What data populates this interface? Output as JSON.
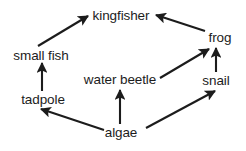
{
  "diagram": {
    "width": 246,
    "height": 151,
    "background_color": "#ffffff",
    "stroke_color": "#1c1c1c",
    "text_color": "#1c1c1c"
  },
  "nodes": [
    {
      "id": "kingfisher",
      "label": "kingfisher",
      "x": 121,
      "y": 15
    },
    {
      "id": "frog",
      "label": "frog",
      "x": 220,
      "y": 37
    },
    {
      "id": "small_fish",
      "label": "small fish",
      "x": 41,
      "y": 55
    },
    {
      "id": "water_beetle",
      "label": "water beetle",
      "x": 120,
      "y": 79
    },
    {
      "id": "snail",
      "label": "snail",
      "x": 216,
      "y": 80
    },
    {
      "id": "tadpole",
      "label": "tadpole",
      "x": 43,
      "y": 99
    },
    {
      "id": "algae",
      "label": "algae",
      "x": 121,
      "y": 132
    }
  ],
  "edges": [
    {
      "id": "small_fish-to-kingfisher",
      "from": "small fish",
      "to": "kingfisher",
      "x1": 38,
      "y1": 46,
      "x2": 88,
      "y2": 16
    },
    {
      "id": "frog-to-kingfisher",
      "from": "frog",
      "to": "kingfisher",
      "x1": 205,
      "y1": 31,
      "x2": 156,
      "y2": 15
    },
    {
      "id": "tadpole-to-small-fish",
      "from": "tadpole",
      "to": "small fish",
      "x1": 42,
      "y1": 91,
      "x2": 42,
      "y2": 63
    },
    {
      "id": "water_beetle-to-frog",
      "from": "water beetle",
      "to": "frog",
      "x1": 160,
      "y1": 78,
      "x2": 209,
      "y2": 49
    },
    {
      "id": "snail-to-frog",
      "from": "snail",
      "to": "frog",
      "x1": 216,
      "y1": 72,
      "x2": 216,
      "y2": 48
    },
    {
      "id": "algae-to-water-beetle",
      "from": "algae",
      "to": "water beetle",
      "x1": 120,
      "y1": 124,
      "x2": 120,
      "y2": 90
    },
    {
      "id": "algae-to-tadpole",
      "from": "algae",
      "to": "tadpole",
      "x1": 104,
      "y1": 130,
      "x2": 41,
      "y2": 109
    },
    {
      "id": "algae-to-snail",
      "from": "algae",
      "to": "snail",
      "x1": 146,
      "y1": 128,
      "x2": 215,
      "y2": 91
    }
  ]
}
